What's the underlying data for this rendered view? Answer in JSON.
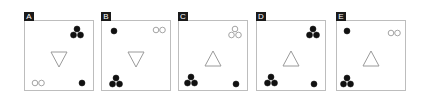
{
  "panels": [
    {
      "id": "A",
      "left": 24,
      "triangle": "down",
      "items": [
        {
          "type": "filled-cluster3",
          "x": 52,
          "y": 11
        },
        {
          "type": "filled-dot",
          "x": 57,
          "y": 62
        },
        {
          "type": "hollow-pair",
          "x": 13,
          "y": 62
        }
      ]
    },
    {
      "id": "B",
      "left": 101,
      "triangle": "down",
      "items": [
        {
          "type": "filled-dot",
          "x": 12,
          "y": 10
        },
        {
          "type": "hollow-pair",
          "x": 57,
          "y": 9
        },
        {
          "type": "filled-cluster3",
          "x": 14,
          "y": 60
        }
      ]
    },
    {
      "id": "C",
      "left": 178,
      "triangle": "up",
      "items": [
        {
          "type": "hollow-cluster3",
          "x": 56,
          "y": 11
        },
        {
          "type": "filled-cluster3",
          "x": 12,
          "y": 59
        },
        {
          "type": "filled-dot",
          "x": 57,
          "y": 63
        }
      ]
    },
    {
      "id": "D",
      "left": 256,
      "triangle": "up",
      "items": [
        {
          "type": "filled-cluster3",
          "x": 56,
          "y": 11
        },
        {
          "type": "filled-cluster3",
          "x": 14,
          "y": 59
        },
        {
          "type": "filled-dot",
          "x": 57,
          "y": 63
        }
      ]
    },
    {
      "id": "E",
      "left": 336,
      "triangle": "up",
      "items": [
        {
          "type": "filled-dot",
          "x": 10,
          "y": 10
        },
        {
          "type": "hollow-pair",
          "x": 57,
          "y": 12
        },
        {
          "type": "filled-cluster3",
          "x": 10,
          "y": 60
        }
      ]
    }
  ],
  "colors": {
    "fill": "#111111",
    "stroke": "#9a9a9a",
    "border": "#bdbdbd",
    "label_bg": "#1a1a1a"
  }
}
